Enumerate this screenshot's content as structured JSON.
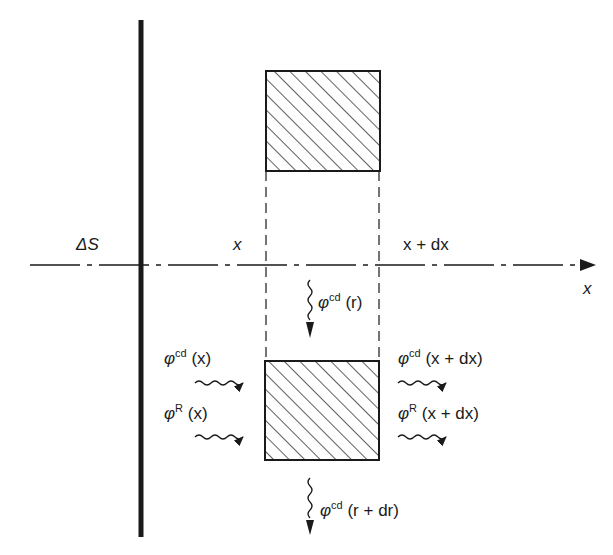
{
  "diagram": {
    "type": "heat-flux-balance",
    "axis": {
      "label": "x",
      "position_label_left": "x",
      "position_label_right": "x + dx"
    },
    "wall": {
      "label": "ΔS"
    },
    "fluxes": {
      "conduction_in_x": {
        "symbol": "φ",
        "superscript": "cd",
        "argument": "(x)"
      },
      "radiation_in_x": {
        "symbol": "φ",
        "superscript": "R",
        "argument": "(x)"
      },
      "conduction_out_x": {
        "symbol": "φ",
        "superscript": "cd",
        "argument": "(x + dx)"
      },
      "radiation_out_x": {
        "symbol": "φ",
        "superscript": "R",
        "argument": "(x + dx)"
      },
      "conduction_in_r": {
        "symbol": "φ",
        "superscript": "cd",
        "argument": "(r)"
      },
      "conduction_out_r": {
        "symbol": "φ",
        "superscript": "cd",
        "argument": "(r + dr)"
      }
    },
    "colors": {
      "ink": "#1a1a1a",
      "background": "#ffffff"
    }
  }
}
